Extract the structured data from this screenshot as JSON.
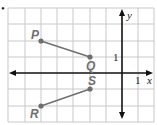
{
  "figure": {
    "type": "coordinate-plane",
    "bullet": "•",
    "axes": {
      "x_label": "x",
      "y_label": "y",
      "x_tick_label": "1",
      "y_tick_label": "1"
    },
    "grid": {
      "x_range": [
        -7,
        2
      ],
      "y_range": [
        -3,
        4
      ]
    },
    "points": [
      {
        "name": "P",
        "x": -5,
        "y": 2
      },
      {
        "name": "Q",
        "x": -2,
        "y": 1
      },
      {
        "name": "S",
        "x": -2,
        "y": -1
      },
      {
        "name": "R",
        "x": -5,
        "y": -2
      }
    ],
    "segments": [
      {
        "from": "P",
        "to": "Q"
      },
      {
        "from": "R",
        "to": "S"
      }
    ],
    "colors": {
      "segment": "#6f6f6f",
      "axis": "#111111",
      "grid": "#c8c8c8"
    }
  }
}
